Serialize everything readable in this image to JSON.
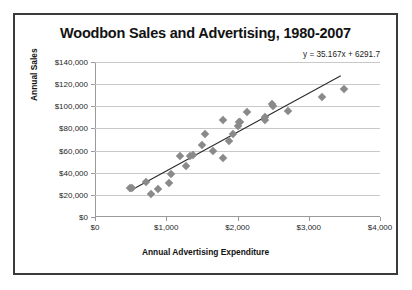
{
  "chart_data": {
    "type": "scatter",
    "title": "Woodbon Sales and Advertising, 1980-2007",
    "xlabel": "Annual Advertising Expenditure",
    "ylabel": "Annual Sales",
    "xlim": [
      0,
      4000
    ],
    "ylim": [
      0,
      140000
    ],
    "grid": true,
    "legend": false,
    "annotation": "y = 35.167x + 6291.7",
    "xticks": [
      0,
      1000,
      2000,
      3000,
      4000
    ],
    "xtick_labels": [
      "$0",
      "$1,000",
      "$2,000",
      "$3,000",
      "$4,000"
    ],
    "yticks": [
      0,
      20000,
      40000,
      60000,
      80000,
      100000,
      120000,
      140000
    ],
    "ytick_labels": [
      "$0",
      "$20,000",
      "$40,000",
      "$60,000",
      "$80,000",
      "$100,000",
      "$120,000",
      "$140,000"
    ],
    "series": [
      {
        "name": "Annual Sales vs Advertising",
        "marker": "diamond",
        "color": "#8a8a8a",
        "points": [
          [
            490,
            26000
          ],
          [
            520,
            26500
          ],
          [
            720,
            32000
          ],
          [
            790,
            21000
          ],
          [
            890,
            25500
          ],
          [
            1040,
            30500
          ],
          [
            1060,
            38500
          ],
          [
            1190,
            55000
          ],
          [
            1280,
            46000
          ],
          [
            1340,
            55000
          ],
          [
            1380,
            56000
          ],
          [
            1500,
            65000
          ],
          [
            1540,
            75000
          ],
          [
            1660,
            59500
          ],
          [
            1790,
            88000
          ],
          [
            1800,
            53500
          ],
          [
            1880,
            68500
          ],
          [
            1930,
            75000
          ],
          [
            2000,
            82000
          ],
          [
            2020,
            86000
          ],
          [
            2040,
            85500
          ],
          [
            2130,
            94500
          ],
          [
            2380,
            88000
          ],
          [
            2390,
            90500
          ],
          [
            2480,
            102000
          ],
          [
            2500,
            100000
          ],
          [
            2710,
            95500
          ],
          [
            3190,
            108500
          ],
          [
            3500,
            115500
          ]
        ]
      }
    ],
    "trendline": {
      "slope": 35.167,
      "intercept": 6291.7,
      "x_start": 480,
      "x_end": 3450,
      "color": "#2b2b2b"
    }
  }
}
